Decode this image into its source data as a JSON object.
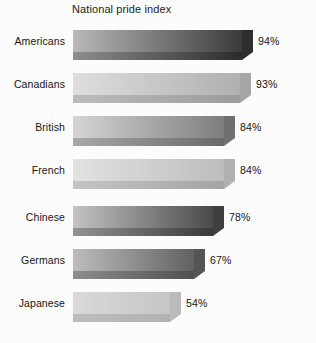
{
  "chart_data": {
    "type": "bar",
    "orientation": "horizontal",
    "title": "National pride index",
    "xlabel": "",
    "ylabel": "",
    "grid": false,
    "legend": "none",
    "value_suffix": "%",
    "xlim": [
      0,
      100
    ],
    "categories": [
      "Americans",
      "Canadians",
      "British",
      "French",
      "Chinese",
      "Germans",
      "Japanese"
    ],
    "values": [
      94,
      93,
      84,
      84,
      78,
      67,
      54
    ],
    "value_labels": [
      "94%",
      "93%",
      "84%",
      "84%",
      "78%",
      "67%",
      "54%"
    ],
    "bars": [
      {
        "category": "Americans",
        "value": 94,
        "value_label": "94%",
        "shade_left": "#b9b9b9",
        "shade_right": "#3a3a3a",
        "lip_left": "#8e8e8e",
        "lip_right": "#2b2b2b",
        "cap_color": "#2e2e2e"
      },
      {
        "category": "Canadians",
        "value": 93,
        "value_label": "93%",
        "shade_left": "#dedede",
        "shade_right": "#b0b0b0",
        "lip_left": "#bcbcbc",
        "lip_right": "#9b9b9b",
        "cap_color": "#a6a6a6"
      },
      {
        "category": "British",
        "value": 84,
        "value_label": "84%",
        "shade_left": "#d5d5d5",
        "shade_right": "#7e7e7e",
        "lip_left": "#a8a8a8",
        "lip_right": "#6a6a6a",
        "cap_color": "#707070"
      },
      {
        "category": "French",
        "value": 84,
        "value_label": "84%",
        "shade_left": "#e2e2e2",
        "shade_right": "#bdbdbd",
        "lip_left": "#c4c4c4",
        "lip_right": "#a4a4a4",
        "cap_color": "#b0b0b0"
      },
      {
        "category": "Chinese",
        "value": 78,
        "value_label": "78%",
        "shade_left": "#c3c3c3",
        "shade_right": "#4a4a4a",
        "lip_left": "#929292",
        "lip_right": "#3a3a3a",
        "cap_color": "#3f3f3f"
      },
      {
        "category": "Germans",
        "value": 67,
        "value_label": "67%",
        "shade_left": "#bdbdbd",
        "shade_right": "#616161",
        "lip_left": "#8d8d8d",
        "lip_right": "#4f4f4f",
        "cap_color": "#545454"
      },
      {
        "category": "Japanese",
        "value": 54,
        "value_label": "54%",
        "shade_left": "#d9d9d9",
        "shade_right": "#c6c6c6",
        "lip_left": "#bdbdbd",
        "lip_right": "#b2b2b2",
        "cap_color": "#bababa"
      }
    ]
  },
  "layout": {
    "background": "#fcfcfc",
    "bar_origin_x": 73,
    "bar_max_width": 180,
    "row_tops": [
      30,
      73,
      116,
      159,
      206,
      249,
      292
    ],
    "label_offset_x": 16
  }
}
